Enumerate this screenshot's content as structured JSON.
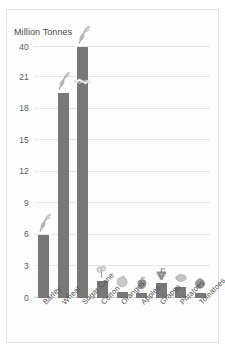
{
  "chart_data": {
    "type": "bar",
    "title": "",
    "subtitle": "",
    "ylabel": "Million Tonnes",
    "xlabel": "",
    "categories": [
      "Barley",
      "Wheat",
      "Sugar Cane",
      "Cotton",
      "Oranges",
      "Apples",
      "Grapes",
      "Potatoes",
      "Tomatoes"
    ],
    "values": [
      6.0,
      19.5,
      40.0,
      1.6,
      0.6,
      0.5,
      1.4,
      1.0,
      0.5
    ],
    "series": [
      {
        "name": "Production",
        "values": [
          6.0,
          19.5,
          40.0,
          1.6,
          0.6,
          0.5,
          1.4,
          1.0,
          0.5
        ]
      }
    ],
    "ytick_labels": [
      "40",
      "21",
      "18",
      "15",
      "12",
      "9",
      "6",
      "3",
      "0"
    ],
    "ytick_values": [
      40,
      21,
      18,
      15,
      12,
      9,
      6,
      3,
      0
    ],
    "ylim": [
      0,
      40
    ],
    "axis_break": {
      "present": true,
      "between": [
        21,
        40
      ],
      "on_category": "Sugar Cane",
      "note": "Y axis is discontinuous between 21 and 40"
    },
    "grid": "horizontal",
    "legend": "none",
    "bar_color": "#787878",
    "gridline_color": "#e6e6e6",
    "axis_color": "#cfcfcf",
    "background_color": "#fdfdfd",
    "icons": [
      {
        "category": "Barley",
        "icon": "barley-stalk-icon"
      },
      {
        "category": "Wheat",
        "icon": "wheat-stalk-icon"
      },
      {
        "category": "Sugar Cane",
        "icon": "sugarcane-stalk-icon"
      },
      {
        "category": "Cotton",
        "icon": "cotton-boll-icon"
      },
      {
        "category": "Oranges",
        "icon": "orange-fruit-icon"
      },
      {
        "category": "Apples",
        "icon": "apple-fruit-icon"
      },
      {
        "category": "Grapes",
        "icon": "grapes-bunch-icon"
      },
      {
        "category": "Potatoes",
        "icon": "potato-icon"
      },
      {
        "category": "Tomatoes",
        "icon": "tomato-icon"
      }
    ]
  }
}
